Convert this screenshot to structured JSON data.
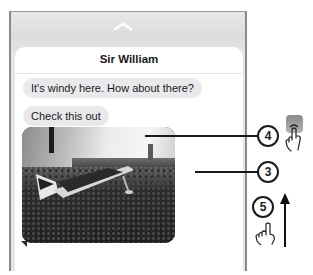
{
  "conversation": {
    "contact_name": "Sir William",
    "messages": [
      {
        "type": "text",
        "text": "It's windy here. How about there?"
      },
      {
        "type": "text",
        "text": "Check this out"
      },
      {
        "type": "image",
        "description": "airplane on grass field photo"
      }
    ]
  },
  "callouts": [
    {
      "number": "4"
    },
    {
      "number": "3"
    },
    {
      "number": "5"
    }
  ],
  "icons": {
    "dismiss": "chevron-up-icon",
    "app": "app-icon",
    "tap_gesture": "hand-pointer-icon",
    "swipe_direction": "arrow-up-icon"
  }
}
